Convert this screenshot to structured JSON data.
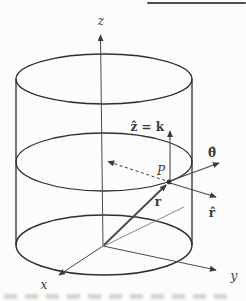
{
  "figure": {
    "colors": {
      "background": "#fcfcfa",
      "ink": "#3a3a3a",
      "outline": "#2e2e2e",
      "rule": "#4f4f4f"
    },
    "labels": {
      "z_axis": "z",
      "y_axis": "y",
      "x_axis": "x",
      "point": "P",
      "position_vector": "r",
      "z_unit_vector": "ẑ = k",
      "theta_unit_vector": "θ̂",
      "r_unit_vector": "r̂"
    }
  }
}
